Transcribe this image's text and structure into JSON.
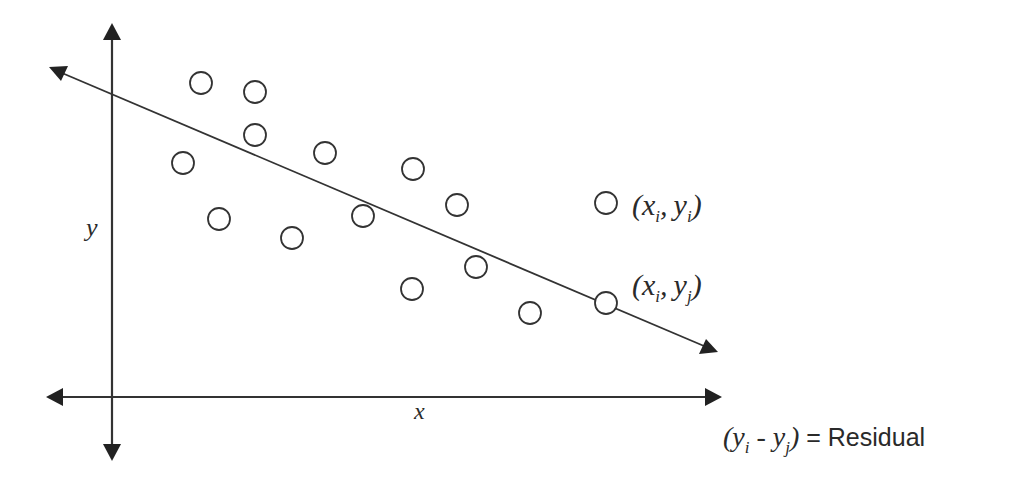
{
  "diagram": {
    "colors": {
      "ink": "#2a2a2a",
      "background": "#ffffff"
    },
    "axes": {
      "x_label": "x",
      "y_label": "y"
    },
    "regression_line": {
      "start": [
        50,
        68
      ],
      "end": [
        718,
        352
      ]
    },
    "points": [
      [
        201,
        83
      ],
      [
        255,
        92
      ],
      [
        255,
        135
      ],
      [
        183,
        163
      ],
      [
        325,
        153
      ],
      [
        413,
        169
      ],
      [
        457,
        205
      ],
      [
        219,
        219
      ],
      [
        292,
        238
      ],
      [
        363,
        216
      ],
      [
        476,
        267
      ],
      [
        412,
        289
      ],
      [
        530,
        313
      ],
      [
        606,
        303
      ]
    ],
    "labels": {
      "observed": {
        "open": "(",
        "x": "x",
        "x_sub": "i",
        "comma": ",",
        "y": "y",
        "y_sub": "i",
        "close": ")"
      },
      "predicted": {
        "open": "(",
        "x": "x",
        "x_sub": "i",
        "comma": ",",
        "y": "y",
        "y_sub": "j",
        "close": ")"
      },
      "residual": {
        "open": "(",
        "y1": "y",
        "y1_sub": "i",
        "minus": " - ",
        "y2": "y",
        "y2_sub": "j",
        "close": ")",
        "equals": " = Residual"
      }
    }
  }
}
